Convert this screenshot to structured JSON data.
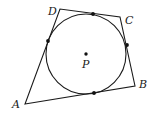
{
  "diagram": {
    "type": "geometry",
    "colors": {
      "stroke": "#1a1a1a",
      "background": "#ffffff"
    },
    "vertices": [
      {
        "name": "A",
        "x": 25,
        "y": 104,
        "label": "A",
        "lx": 12,
        "ly": 108
      },
      {
        "name": "B",
        "x": 135,
        "y": 86,
        "label": "B",
        "lx": 139,
        "ly": 88
      },
      {
        "name": "C",
        "x": 120,
        "y": 17,
        "label": "C",
        "lx": 125,
        "ly": 24
      },
      {
        "name": "D",
        "x": 60,
        "y": 9,
        "label": "D",
        "lx": 48,
        "ly": 15
      }
    ],
    "circle": {
      "cx": 86,
      "cy": 54,
      "r": 40
    },
    "center": {
      "name": "P",
      "x": 86,
      "y": 54,
      "label": "P",
      "lx": 82,
      "ly": 68
    },
    "tangent_points": [
      {
        "x": 93,
        "y": 14
      },
      {
        "x": 48,
        "y": 41
      },
      {
        "x": 127,
        "y": 45
      },
      {
        "x": 94,
        "y": 93
      }
    ]
  }
}
